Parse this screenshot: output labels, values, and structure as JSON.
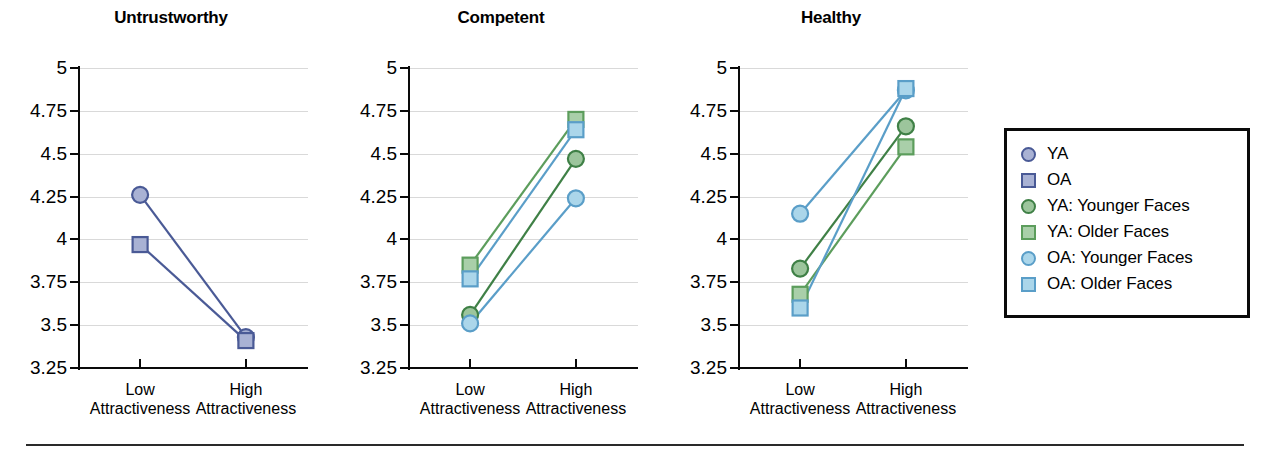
{
  "figure": {
    "top_partial_text": "",
    "footer_rule": true,
    "background": "#ffffff"
  },
  "colors": {
    "ya_line": "#4a5a96",
    "ya_fill": "#a9b2d4",
    "oa_line": "#4a5a96",
    "oa_fill": "#a9b2d4",
    "ya_younger_line": "#3f8046",
    "ya_younger_fill": "#9cc59c",
    "ya_older_line": "#5c9d5c",
    "ya_older_fill": "#a9cfa9",
    "oa_younger_line": "#5a9ec8",
    "oa_younger_fill": "#abd6ea",
    "oa_older_line": "#5a9ec8",
    "oa_older_fill": "#abd6ea",
    "gridline": "#d9d9d9",
    "axis": "#0a0a0a",
    "text": "#000000"
  },
  "legend": {
    "position": "right",
    "entries": [
      {
        "label": "YA",
        "marker": "circle",
        "line": "#4a5a96",
        "fill": "#a9b2d4"
      },
      {
        "label": "OA",
        "marker": "square",
        "line": "#4a5a96",
        "fill": "#a9b2d4"
      },
      {
        "label": "YA: Younger Faces",
        "marker": "circle",
        "line": "#3f8046",
        "fill": "#9cc59c"
      },
      {
        "label": "YA: Older Faces",
        "marker": "square",
        "line": "#5c9d5c",
        "fill": "#a9cfa9"
      },
      {
        "label": "OA: Younger Faces",
        "marker": "circle",
        "line": "#5a9ec8",
        "fill": "#abd6ea"
      },
      {
        "label": "OA: Older Faces",
        "marker": "square",
        "line": "#5a9ec8",
        "fill": "#abd6ea"
      }
    ]
  },
  "chart_data": [
    {
      "type": "line",
      "title": "Untrustworthy",
      "xlabel": "",
      "ylabel": "",
      "categories": [
        "Low\nAttractiveness",
        "High\nAttractiveness"
      ],
      "xtick_labels": [
        {
          "line1": "Low",
          "line2": "Attractiveness"
        },
        {
          "line1": "High",
          "line2": "Attractiveness"
        }
      ],
      "ylim": [
        3.25,
        5
      ],
      "yticks": [
        5,
        4.75,
        4.5,
        4.25,
        4,
        3.75,
        3.5,
        3.25
      ],
      "ytick_labels": [
        "5",
        "4.75",
        "4.5",
        "4.25",
        "4",
        "3.75",
        "3.5",
        "3.25"
      ],
      "grid": true,
      "series": [
        {
          "name": "YA",
          "marker": "circle",
          "line": "#4a5a96",
          "fill": "#a9b2d4",
          "values": [
            4.26,
            3.43
          ]
        },
        {
          "name": "OA",
          "marker": "square",
          "line": "#4a5a96",
          "fill": "#a9b2d4",
          "values": [
            3.97,
            3.41
          ]
        }
      ]
    },
    {
      "type": "line",
      "title": "Competent",
      "xlabel": "",
      "ylabel": "",
      "categories": [
        "Low\nAttractiveness",
        "High\nAttractiveness"
      ],
      "xtick_labels": [
        {
          "line1": "Low",
          "line2": "Attractiveness"
        },
        {
          "line1": "High",
          "line2": "Attractiveness"
        }
      ],
      "ylim": [
        3.25,
        5
      ],
      "yticks": [
        5,
        4.75,
        4.5,
        4.25,
        4,
        3.75,
        3.5,
        3.25
      ],
      "ytick_labels": [
        "5",
        "4.75",
        "4.5",
        "4.25",
        "4",
        "3.75",
        "3.5",
        "3.25"
      ],
      "grid": true,
      "series": [
        {
          "name": "YA: Younger Faces",
          "marker": "circle",
          "line": "#3f8046",
          "fill": "#9cc59c",
          "values": [
            3.56,
            4.47
          ]
        },
        {
          "name": "YA: Older Faces",
          "marker": "square",
          "line": "#5c9d5c",
          "fill": "#a9cfa9",
          "values": [
            3.85,
            4.7
          ]
        },
        {
          "name": "OA: Younger Faces",
          "marker": "circle",
          "line": "#5a9ec8",
          "fill": "#abd6ea",
          "values": [
            3.51,
            4.24
          ]
        },
        {
          "name": "OA: Older Faces",
          "marker": "square",
          "line": "#5a9ec8",
          "fill": "#abd6ea",
          "values": [
            3.77,
            4.64
          ]
        }
      ]
    },
    {
      "type": "line",
      "title": "Healthy",
      "xlabel": "",
      "ylabel": "",
      "categories": [
        "Low\nAttractiveness",
        "High\nAttractiveness"
      ],
      "xtick_labels": [
        {
          "line1": "Low",
          "line2": "Attractiveness"
        },
        {
          "line1": "High",
          "line2": "Attractiveness"
        }
      ],
      "ylim": [
        3.25,
        5
      ],
      "yticks": [
        5,
        4.75,
        4.5,
        4.25,
        4,
        3.75,
        3.5,
        3.25
      ],
      "ytick_labels": [
        "5",
        "4.75",
        "4.5",
        "4.25",
        "4",
        "3.75",
        "3.5",
        "3.25"
      ],
      "grid": true,
      "series": [
        {
          "name": "YA: Younger Faces",
          "marker": "circle",
          "line": "#3f8046",
          "fill": "#9cc59c",
          "values": [
            3.83,
            4.66
          ]
        },
        {
          "name": "YA: Older Faces",
          "marker": "square",
          "line": "#5c9d5c",
          "fill": "#a9cfa9",
          "values": [
            3.68,
            4.54
          ]
        },
        {
          "name": "OA: Younger Faces",
          "marker": "circle",
          "line": "#5a9ec8",
          "fill": "#abd6ea",
          "values": [
            4.15,
            4.87
          ]
        },
        {
          "name": "OA: Older Faces",
          "marker": "square",
          "line": "#5a9ec8",
          "fill": "#abd6ea",
          "values": [
            3.6,
            4.88
          ]
        }
      ]
    }
  ]
}
